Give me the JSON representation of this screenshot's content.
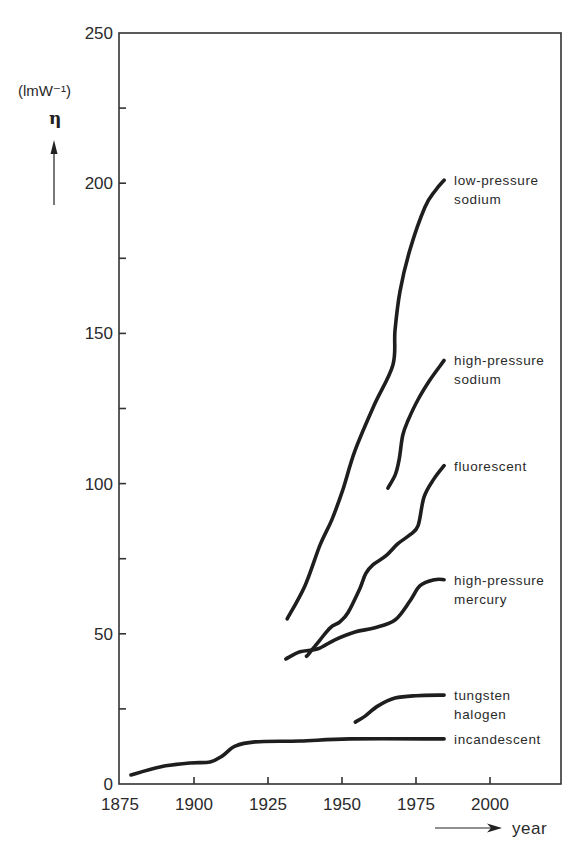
{
  "chart_data": {
    "type": "line",
    "title": "",
    "xlabel": "year",
    "ylabel": "η (lmW⁻¹)",
    "y_unit": "(lmW⁻¹)",
    "y_symbol": "η",
    "xlim": [
      1875,
      2025
    ],
    "ylim": [
      0,
      250
    ],
    "x_ticks": [
      1875,
      1900,
      1925,
      1950,
      1975,
      2000
    ],
    "x_tick_labels": [
      "1875",
      "1900",
      "1925",
      "1950",
      "1975",
      "2000"
    ],
    "y_ticks": [
      0,
      50,
      100,
      150,
      200,
      250
    ],
    "y_tick_labels": [
      "0",
      "50",
      "100",
      "150",
      "200",
      "250"
    ],
    "y_minor_ticks": [
      25,
      75,
      125,
      175,
      225
    ],
    "grid": false,
    "legend": "inline labels at right end of each curve",
    "series": [
      {
        "name": "low-pressure sodium",
        "label_lines": [
          "low-pressure",
          "sodium"
        ],
        "x": [
          1931.5,
          1937.5,
          1942.6,
          1946.6,
          1950.3,
          1954.4,
          1960.8,
          1967.2,
          1967.9,
          1969.6,
          1973,
          1978,
          1981.5,
          1984.5
        ],
        "y": [
          55,
          66,
          79.6,
          88,
          98,
          111,
          126,
          139.5,
          151,
          164,
          178,
          192,
          197.5,
          201
        ]
      },
      {
        "name": "high-pressure sodium",
        "label_lines": [
          "high-pressure",
          "sodium"
        ],
        "x": [
          1965.5,
          1968,
          1969.3,
          1970.5,
          1972.3,
          1975.7,
          1979.7,
          1984.5
        ],
        "y": [
          98.5,
          103,
          108,
          116,
          121,
          128,
          134.5,
          141
        ]
      },
      {
        "name": "fluorescent",
        "label_lines": [
          "fluorescent"
        ],
        "x": [
          1938,
          1938.5,
          1942.6,
          1946,
          1949.3,
          1952,
          1956,
          1958,
          1960.5,
          1964.9,
          1968.9,
          1973,
          1975.7,
          1977.7,
          1981,
          1984.5
        ],
        "y": [
          42.6,
          43,
          48,
          52,
          54,
          57,
          65,
          70,
          73,
          76,
          80,
          83,
          86,
          95.5,
          101.5,
          106
        ]
      },
      {
        "name": "high-pressure mercury",
        "label_lines": [
          "high-pressure",
          "mercury"
        ],
        "x": [
          1931,
          1935.8,
          1941.9,
          1947.6,
          1954.4,
          1961.1,
          1967.9,
          1973,
          1976.4,
          1981.4,
          1984.5
        ],
        "y": [
          41.6,
          44,
          45,
          48,
          50.6,
          52,
          54.6,
          61,
          66,
          68,
          68
        ]
      },
      {
        "name": "tungsten halogen",
        "label_lines": [
          "tungsten",
          "halogen"
        ],
        "x": [
          1954.5,
          1957.8,
          1962.2,
          1967.9,
          1975,
          1984.5
        ],
        "y": [
          20.6,
          22.6,
          26,
          28.6,
          29.4,
          29.6
        ]
      },
      {
        "name": "incandescent",
        "label_lines": [
          "incandescent"
        ],
        "x": [
          1878.7,
          1888.5,
          1898.6,
          1905.4,
          1909.5,
          1913.9,
          1920.6,
          1935.8,
          1952.7,
          1984.5
        ],
        "y": [
          3,
          5.7,
          7,
          7.3,
          9.3,
          12.6,
          14,
          14.3,
          15,
          15
        ]
      }
    ]
  }
}
